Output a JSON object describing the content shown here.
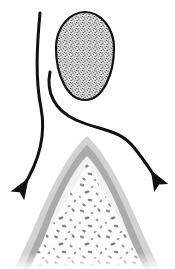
{
  "figure": {
    "background_color": "#ffffff",
    "width": 175,
    "height": 269
  },
  "palette": {
    "outline": "#111111",
    "arrow": "#111111",
    "egg_fill": "#d9d9d9",
    "egg_stipple": "#3a3a3a",
    "outer_layer": "#d2d2d2",
    "mid_layer": "#ababab",
    "inner_layer": "#ededed",
    "core_fill": "#fbfbfb",
    "core_speckle": "#8a8a8a",
    "white": "#ffffff"
  },
  "shapes": {
    "egg": {
      "label": "stippled ovoid mass",
      "name": "egg-shape",
      "center_x": 85,
      "center_y": 57,
      "radius_x": 29,
      "radius_y": 45,
      "outline_width": 2.2,
      "texture": "stipple"
    },
    "tooth": {
      "label": "tooth root cross-section",
      "name": "tooth-shape",
      "apex_x": 87,
      "apex_y": 136,
      "base_y": 269,
      "left_x": 8,
      "right_x": 167,
      "layers": [
        {
          "name": "outer-layer",
          "color_key": "outer_layer",
          "inset": 0
        },
        {
          "name": "mid-layer",
          "color_key": "mid_layer",
          "inset": 9
        },
        {
          "name": "inner-layer",
          "color_key": "inner_layer",
          "inset": 20
        },
        {
          "name": "core-layer",
          "color_key": "core_fill",
          "inset": 27
        }
      ],
      "core_texture": "speckle"
    },
    "arrow_left": {
      "label": "left curved arrow",
      "name": "arrow-left",
      "start": [
        40,
        13
      ],
      "end": [
        20,
        193
      ],
      "stroke_width": 3.0,
      "head_size": 11,
      "direction": "down-left"
    },
    "arrow_right": {
      "label": "right curved arrow",
      "name": "arrow-right",
      "start": [
        50,
        72
      ],
      "end": [
        161,
        184
      ],
      "stroke_width": 3.0,
      "head_size": 11,
      "direction": "down-right"
    }
  },
  "annotations": {
    "caption": ""
  }
}
